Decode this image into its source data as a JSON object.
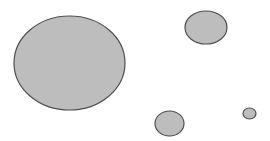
{
  "diagram": {
    "background": "#ffffff",
    "fill_color": "#bdbdbd",
    "stroke_color": "#4f4f4f",
    "stroke_width": 1.2,
    "shapes": [
      {
        "name": "large-circle",
        "cx": 69.5,
        "cy": 63,
        "rx": 55.5,
        "ry": 47
      },
      {
        "name": "upper-right-circle",
        "cx": 206,
        "cy": 27.5,
        "rx": 21,
        "ry": 16.5
      },
      {
        "name": "bottom-circle",
        "cx": 169.5,
        "cy": 123.5,
        "rx": 14.5,
        "ry": 12.5
      },
      {
        "name": "small-circle",
        "cx": 249.5,
        "cy": 113.5,
        "rx": 6.5,
        "ry": 5.5
      }
    ]
  }
}
